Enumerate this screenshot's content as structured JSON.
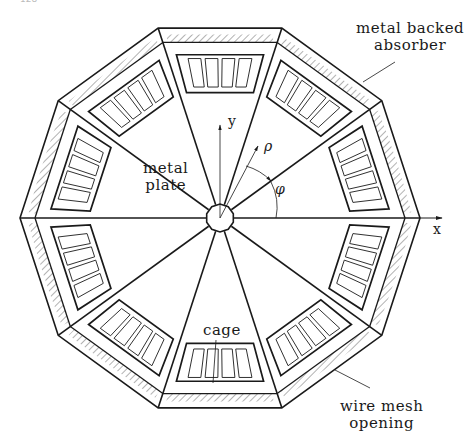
{
  "figure": {
    "page_number": "128",
    "shape": "decagon",
    "sectors": 10,
    "geometry": {
      "center": [
        220,
        218
      ],
      "outer_radius_x": 200,
      "outer_radius_y": 209,
      "hub_radius": 14,
      "absorber_inner_scale": 0.925,
      "cage_outer_scale": 0.86,
      "cage_inner_scale": 0.66,
      "cells_per_sector": 4
    },
    "colors": {
      "line": "#1a1a1a",
      "hatch": "#555555",
      "background": "#ffffff"
    },
    "labels": {
      "metal_backed_absorber_line1": "metal backed",
      "metal_backed_absorber_line2": "absorber",
      "metal_plate_line1": "metal",
      "metal_plate_line2": "plate",
      "cage": "cage",
      "wire_mesh_line1": "wire mesh",
      "wire_mesh_line2": "opening"
    },
    "axes": {
      "x_label": "x",
      "y_label": "y",
      "rho_label": "ρ",
      "phi_label": "φ"
    }
  }
}
